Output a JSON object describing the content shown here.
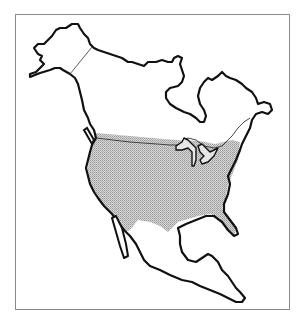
{
  "map": {
    "type": "outline-map",
    "region": "North America",
    "highlighted_region": "Contiguous United States",
    "highlight_style": "stippled gray shading",
    "other_regions": [
      "Alaska",
      "Canada",
      "Mexico",
      "Central America"
    ],
    "colors": {
      "outline": "#111111",
      "highlight_fill": "#c8c8c8",
      "frame": "#8a8a8a",
      "background": "#ffffff"
    },
    "frame": true
  }
}
